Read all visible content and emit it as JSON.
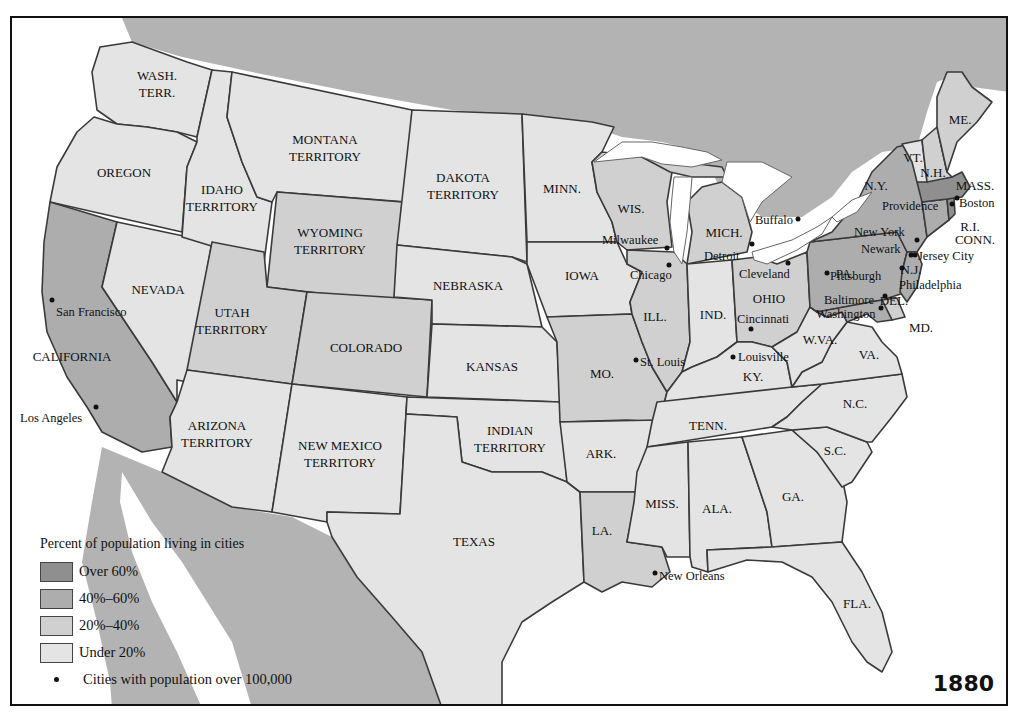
{
  "map": {
    "year": "1880",
    "colors": {
      "over_60": "#8f8f8f",
      "40_60": "#adadad",
      "20_40": "#d0d0d0",
      "under_20": "#e4e4e4",
      "foreign_land": "#b3b3b3",
      "water": "#ffffff",
      "border": "#3a3a3a"
    },
    "legend": {
      "title": "Percent of population living in cities",
      "items": [
        {
          "label": "Over 60%",
          "category": "over_60"
        },
        {
          "label": "40%–60%",
          "category": "40_60"
        },
        {
          "label": "20%–40%",
          "category": "20_40"
        },
        {
          "label": "Under 20%",
          "category": "under_20"
        }
      ],
      "city_marker_label": "Cities with population over 100,000"
    },
    "states": [
      {
        "name": "WASH.\nTERR.",
        "category": "under_20"
      },
      {
        "name": "OREGON",
        "category": "under_20"
      },
      {
        "name": "CALIFORNIA",
        "category": "40_60"
      },
      {
        "name": "NEVADA",
        "category": "under_20"
      },
      {
        "name": "IDAHO\nTERRITORY",
        "category": "under_20"
      },
      {
        "name": "MONTANA\nTERRITORY",
        "category": "under_20"
      },
      {
        "name": "WYOMING\nTERRITORY",
        "category": "20_40"
      },
      {
        "name": "UTAH\nTERRITORY",
        "category": "20_40"
      },
      {
        "name": "COLORADO",
        "category": "20_40"
      },
      {
        "name": "ARIZONA\nTERRITORY",
        "category": "under_20"
      },
      {
        "name": "NEW MEXICO\nTERRITORY",
        "category": "under_20"
      },
      {
        "name": "DAKOTA\nTERRITORY",
        "category": "under_20"
      },
      {
        "name": "NEBRASKA",
        "category": "under_20"
      },
      {
        "name": "KANSAS",
        "category": "under_20"
      },
      {
        "name": "INDIAN\nTERRITORY",
        "category": "under_20"
      },
      {
        "name": "TEXAS",
        "category": "under_20"
      },
      {
        "name": "MINN.",
        "category": "under_20"
      },
      {
        "name": "IOWA",
        "category": "under_20"
      },
      {
        "name": "MO.",
        "category": "20_40"
      },
      {
        "name": "ARK.",
        "category": "under_20"
      },
      {
        "name": "LA.",
        "category": "20_40"
      },
      {
        "name": "WIS.",
        "category": "20_40"
      },
      {
        "name": "ILL.",
        "category": "20_40"
      },
      {
        "name": "MICH.",
        "category": "20_40"
      },
      {
        "name": "IND.",
        "category": "under_20"
      },
      {
        "name": "OHIO",
        "category": "20_40"
      },
      {
        "name": "KY.",
        "category": "under_20"
      },
      {
        "name": "TENN.",
        "category": "under_20"
      },
      {
        "name": "MISS.",
        "category": "under_20"
      },
      {
        "name": "ALA.",
        "category": "under_20"
      },
      {
        "name": "GA.",
        "category": "under_20"
      },
      {
        "name": "FLA.",
        "category": "under_20"
      },
      {
        "name": "S.C.",
        "category": "under_20"
      },
      {
        "name": "N.C.",
        "category": "under_20"
      },
      {
        "name": "VA.",
        "category": "under_20"
      },
      {
        "name": "W.VA.",
        "category": "under_20"
      },
      {
        "name": "PA.",
        "category": "40_60"
      },
      {
        "name": "N.Y.",
        "category": "40_60"
      },
      {
        "name": "N.J.",
        "category": "40_60"
      },
      {
        "name": "DEL.",
        "category": "20_40"
      },
      {
        "name": "MD.",
        "category": "40_60"
      },
      {
        "name": "CONN.",
        "category": "40_60"
      },
      {
        "name": "R.I.",
        "category": "over_60"
      },
      {
        "name": "MASS.",
        "category": "over_60"
      },
      {
        "name": "VT.",
        "category": "under_20"
      },
      {
        "name": "N.H.",
        "category": "20_40"
      },
      {
        "name": "ME.",
        "category": "20_40"
      }
    ],
    "state_labels": {
      "wash": "WASH.",
      "wash2": "TERR.",
      "oregon": "OREGON",
      "california": "CALIFORNIA",
      "nevada": "NEVADA",
      "idaho": "IDAHO",
      "idaho2": "TERRITORY",
      "montana": "MONTANA",
      "montana2": "TERRITORY",
      "wyoming": "WYOMING",
      "wyoming2": "TERRITORY",
      "utah": "UTAH",
      "utah2": "TERRITORY",
      "colorado": "COLORADO",
      "arizona": "ARIZONA",
      "arizona2": "TERRITORY",
      "newmexico": "NEW MEXICO",
      "newmexico2": "TERRITORY",
      "dakota": "DAKOTA",
      "dakota2": "TERRITORY",
      "nebraska": "NEBRASKA",
      "kansas": "KANSAS",
      "indian": "INDIAN",
      "indian2": "TERRITORY",
      "texas": "TEXAS",
      "minn": "MINN.",
      "iowa": "IOWA",
      "mo": "MO.",
      "ark": "ARK.",
      "la": "LA.",
      "wis": "WIS.",
      "ill": "ILL.",
      "mich": "MICH.",
      "ind": "IND.",
      "ohio": "OHIO",
      "ky": "KY.",
      "tenn": "TENN.",
      "miss": "MISS.",
      "ala": "ALA.",
      "ga": "GA.",
      "fla": "FLA.",
      "sc": "S.C.",
      "nc": "N.C.",
      "va": "VA.",
      "wva": "W.VA.",
      "pa": "PA.",
      "ny": "N.Y.",
      "nj": "N.J.",
      "del": "DEL.",
      "md": "MD.",
      "conn": "CONN.",
      "ri": "R.I.",
      "mass": "MASS.",
      "vt": "VT.",
      "nh": "N.H.",
      "me": "ME."
    },
    "cities": {
      "san_francisco": "San Francisco",
      "los_angeles": "Los Angeles",
      "milwaukee": "Milwaukee",
      "chicago": "Chicago",
      "detroit": "Detroit",
      "cleveland": "Cleveland",
      "buffalo": "Buffalo",
      "st_louis": "St. Louis",
      "louisville": "Louisville",
      "cincinnati": "Cincinnati",
      "pittsburgh": "Pittsburgh",
      "new_york": "New York",
      "newark": "Newark",
      "jersey_city": "Jersey City",
      "philadelphia": "Philadelphia",
      "baltimore": "Baltimore",
      "washington": "Washington",
      "boston": "Boston",
      "providence": "Providence",
      "new_orleans": "New Orleans"
    }
  }
}
